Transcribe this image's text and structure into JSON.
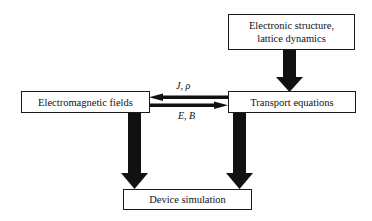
{
  "diagram": {
    "nodes": [
      {
        "id": "electronic",
        "label_line1": "Electronic structure,",
        "label_line2": "lattice dynamics"
      },
      {
        "id": "em_fields",
        "label": "Electromagnetic fields"
      },
      {
        "id": "transport",
        "label": "Transport equations"
      },
      {
        "id": "device",
        "label": "Device simulation"
      }
    ],
    "edges": [
      {
        "from": "electronic",
        "to": "transport",
        "style": "thick"
      },
      {
        "from": "transport",
        "to": "em_fields",
        "label": "J, ρ",
        "style": "thin"
      },
      {
        "from": "em_fields",
        "to": "transport",
        "label": "E, B",
        "style": "thin"
      },
      {
        "from": "em_fields",
        "to": "device",
        "style": "thick"
      },
      {
        "from": "transport",
        "to": "device",
        "style": "thick"
      }
    ],
    "colors": {
      "stroke": "#111111",
      "background": "#ffffff"
    }
  }
}
